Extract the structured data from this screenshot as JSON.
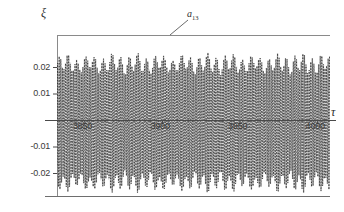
{
  "chart_data": {
    "type": "line",
    "title": "",
    "subtitle": "",
    "xlabel": "τ",
    "ylabel": "ξ",
    "xlim": [
      3832,
      4008
    ],
    "ylim": [
      -0.0268,
      0.0268
    ],
    "grid": false,
    "legend_position": "none",
    "x_ticks": [
      {
        "value": 3850,
        "label": "3850"
      },
      {
        "value": 3900,
        "label": "3900"
      },
      {
        "value": 3950,
        "label": "3950"
      },
      {
        "value": 4000,
        "label": "4000"
      }
    ],
    "y_ticks": [
      {
        "value": 0.02,
        "label": "0.02"
      },
      {
        "value": 0.01,
        "label": "0.01"
      },
      {
        "value": -0.01,
        "label": "-0.01"
      },
      {
        "value": -0.02,
        "label": "-0.02"
      }
    ],
    "annotations": [
      {
        "name": "a13",
        "text": "a",
        "subscript": "13",
        "x": 3917,
        "y": 0.0262,
        "leader_to_x": 3903,
        "leader_to_y": 0.0232
      }
    ],
    "series": [
      {
        "name": "a13",
        "color": "#2f2f2f",
        "style": "dotted-dense",
        "description": "High-frequency oscillation with slowly varying amplitude envelope",
        "carrier_period": 1.02,
        "envelope_period": 5.62,
        "envelope_min": 0.0196,
        "envelope_max": 0.0255,
        "envelope_mean": 0.0232,
        "offset": -0.0009,
        "x_start": 3832,
        "x_end": 4008,
        "samples": 1760
      }
    ]
  },
  "axes": {
    "zero_line_label": "0",
    "top_rule_value": 0.0255,
    "bottom_rule_value": -0.0268
  }
}
